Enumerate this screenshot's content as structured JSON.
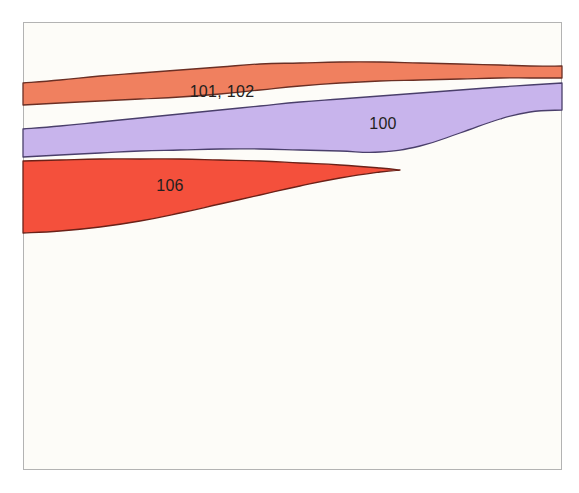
{
  "figure": {
    "kind": "stratigraphic-band-diagram",
    "background_color": "#ffffff",
    "frame": {
      "name": "plot-frame",
      "x": 23,
      "y": 22,
      "width": 539,
      "height": 448,
      "fill_color": "#fdfcf8",
      "border_color": "#b3b3b3",
      "border_width": 1
    }
  },
  "chart_data": {
    "type": "area",
    "title": "",
    "xlabel": "",
    "ylabel": "",
    "grid": false,
    "legend_position": "inline-labels",
    "xlim": [
      23,
      562
    ],
    "ylim": [
      22,
      470
    ],
    "note": "Three stacked curvilinear bands (unit envelopes) drawn across the upper portion of a bounded frame; vertical axis increases downward (depth-like). Values below are traced band boundary y-positions in pixel coordinates sampled at shared x stations.",
    "x": [
      23,
      60,
      100,
      140,
      180,
      220,
      260,
      300,
      340,
      380,
      420,
      460,
      500,
      530,
      562
    ],
    "series": [
      {
        "name": "101, 102",
        "label": "101, 102",
        "color": "#f0805f",
        "outline_color": "#6b2f24",
        "label_x": 222,
        "label_y": 92,
        "top_y": [
          83,
          80,
          76,
          73,
          70,
          67,
          64,
          63,
          62,
          62,
          63,
          64,
          65,
          66,
          66
        ],
        "bottom_y": [
          105,
          103,
          101,
          99,
          97,
          94,
          90,
          86,
          83,
          81,
          80,
          79,
          78,
          78,
          78
        ]
      },
      {
        "name": "100",
        "label": "100",
        "color": "#c8b4ec",
        "outline_color": "#4a3f6b",
        "label_x": 383,
        "label_y": 124,
        "top_y": [
          129,
          126,
          122,
          118,
          114,
          110,
          106,
          102,
          99,
          96,
          93,
          90,
          87,
          85,
          83
        ],
        "bottom_y": [
          157,
          155,
          153,
          151,
          150,
          149,
          149,
          150,
          151,
          152,
          146,
          133,
          119,
          112,
          110
        ]
      },
      {
        "name": "106",
        "label": "106",
        "color": "#f4503c",
        "outline_color": "#6b2118",
        "label_x": 170,
        "label_y": 186,
        "top_y": [
          161,
          160,
          159,
          159,
          159,
          160,
          161,
          163,
          165,
          168,
          null,
          null,
          null,
          null,
          null
        ],
        "bottom_y": [
          233,
          231,
          227,
          221,
          213,
          204,
          195,
          186,
          178,
          172,
          null,
          null,
          null,
          null,
          null
        ],
        "pinch_out_x": 400,
        "pinch_out_y": 170
      }
    ],
    "labels": [
      "101, 102",
      "100",
      "106"
    ]
  },
  "colors": {
    "band_orange": "#f0805f",
    "band_purple": "#c8b4ec",
    "band_red": "#f4503c",
    "outline_orange": "#6b2f24",
    "outline_purple": "#4a3f6b",
    "outline_red": "#6b2118",
    "frame_border": "#b3b3b3",
    "paper": "#fdfcf8",
    "label_text": "#231f20"
  }
}
